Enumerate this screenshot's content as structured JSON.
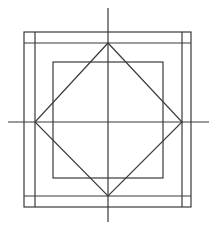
{
  "diagram": {
    "type": "geometric-construction",
    "stroke_color": "#3a3a3a",
    "background": "#ffffff",
    "outer_square": {
      "x1": 24,
      "y1": 32,
      "x2": 191,
      "y2": 207
    },
    "frame_inner_lines": {
      "left_x": 35,
      "right_x": 182,
      "top_y": 43,
      "bottom_y": 196
    },
    "inner_square": {
      "x1": 53,
      "y1": 62,
      "x2": 163,
      "y2": 178
    },
    "axes": {
      "vertical": {
        "x": 108,
        "y1": 8,
        "y2": 222
      },
      "horizontal": {
        "y": 122,
        "x1": 8,
        "x2": 209
      }
    },
    "diamond": {
      "top": [
        108,
        43
      ],
      "right": [
        182,
        122
      ],
      "bottom": [
        108,
        196
      ],
      "left": [
        35,
        122
      ]
    }
  }
}
